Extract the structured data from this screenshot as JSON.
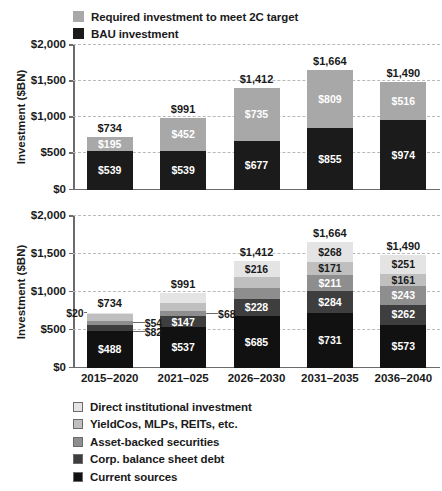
{
  "chart_data": [
    {
      "type": "bar",
      "id": "top",
      "stacked": true,
      "title": "",
      "xlabel": "",
      "ylabel": "Investment ($BN)",
      "ylim": [
        0,
        2000
      ],
      "yticks": [
        "$0",
        "$500",
        "$1,000",
        "$1,500",
        "$2,000"
      ],
      "ytick_values": [
        0,
        500,
        1000,
        1500,
        2000
      ],
      "grid": true,
      "legend_position": "top-left",
      "categories": [
        "2015–2020",
        "2021–025",
        "2026–2030",
        "2031–2035",
        "2036–2040"
      ],
      "series": [
        {
          "name": "BAU investment",
          "color": "#1b1b1b",
          "label_color": "#ffffff",
          "values": [
            539,
            539,
            677,
            855,
            974
          ],
          "labels": [
            "$539",
            "$539",
            "$677",
            "$855",
            "$974"
          ]
        },
        {
          "name": "Required investment to meet 2C target",
          "color": "#a8a8a8",
          "label_color": "#ffffff",
          "values": [
            195,
            452,
            735,
            809,
            516
          ],
          "labels": [
            "$195",
            "$452",
            "$735",
            "$809",
            "$516"
          ]
        }
      ],
      "totals": [
        734,
        991,
        1412,
        1664,
        1490
      ],
      "total_labels": [
        "$734",
        "$991",
        "$1,412",
        "$1,664",
        "$1,490"
      ]
    },
    {
      "type": "bar",
      "id": "bottom",
      "stacked": true,
      "title": "",
      "xlabel": "",
      "ylabel": "Investment ($BN)",
      "ylim": [
        0,
        2000
      ],
      "yticks": [
        "$0",
        "$500",
        "$1,000",
        "$1,500",
        "$2,000"
      ],
      "ytick_values": [
        0,
        500,
        1000,
        1500,
        2000
      ],
      "grid": true,
      "legend_position": "below",
      "categories": [
        "2015–2020",
        "2021–025",
        "2026–2030",
        "2031–2035",
        "2036–2040"
      ],
      "series": [
        {
          "name": "Current sources",
          "color": "#111111",
          "label_color": "#ffffff",
          "values": [
            488,
            537,
            685,
            731,
            573
          ],
          "labels": [
            "$488",
            "$537",
            "$685",
            "$731",
            "$573"
          ]
        },
        {
          "name": "Corp. balance sheet debt",
          "color": "#3e3e3e",
          "label_color": "#ffffff",
          "values": [
            82,
            147,
            228,
            284,
            262
          ],
          "labels": [
            "$82",
            "$147",
            "$228",
            "$284",
            "$262"
          ]
        },
        {
          "name": "Asset-backed securities",
          "color": "#8e8e8e",
          "label_color": "#ffffff",
          "values": [
            54,
            68,
            139,
            211,
            243
          ],
          "labels": [
            "$54",
            "$68",
            "$139",
            "$211",
            "$243"
          ]
        },
        {
          "name": "YieldCos, MLPs, REITs, etc.",
          "color": "#bfbfbf",
          "label_color": "#1a1a1a",
          "values": [
            89,
            102,
            144,
            171,
            161
          ],
          "labels": [
            "$89",
            "$102",
            "$144",
            "$171",
            "$161"
          ]
        },
        {
          "name": "Direct institutional investment",
          "color": "#e4e4e4",
          "label_color": "#1a1a1a",
          "values": [
            20,
            137,
            216,
            268,
            251
          ],
          "labels": [
            "$20",
            "$137",
            "$216",
            "$268",
            "$251"
          ]
        }
      ],
      "totals": [
        734,
        991,
        1412,
        1664,
        1490
      ],
      "total_labels": [
        "$734",
        "$991",
        "$1,412",
        "$1,664",
        "$1,490"
      ],
      "callouts": [
        {
          "label": "$20",
          "series": "Direct institutional investment",
          "category": "2015–2020",
          "side": "left"
        },
        {
          "label": "$54",
          "series": "Asset-backed securities",
          "category": "2015–2020",
          "side": "right"
        },
        {
          "label": "$82",
          "series": "Corp. balance sheet debt",
          "category": "2015–2020",
          "side": "right"
        },
        {
          "label": "$68",
          "series": "Asset-backed securities",
          "category": "2021–025",
          "side": "right"
        }
      ]
    }
  ],
  "top_chart": {
    "ylabel": "Investment ($BN)",
    "legend": [
      {
        "label": "Required investment to meet 2C target",
        "color": "#a8a8a8"
      },
      {
        "label": "BAU investment",
        "color": "#1b1b1b"
      }
    ],
    "yticks": [
      "$2,000",
      "$1,500",
      "$1,000",
      "$500",
      "$0"
    ],
    "totals": [
      "$734",
      "$991",
      "$1,412",
      "$1,664",
      "$1,490"
    ],
    "bars": [
      {
        "category": "2015–2020",
        "bau": "$539",
        "required": "$195"
      },
      {
        "category": "2021–025",
        "bau": "$539",
        "required": "$452"
      },
      {
        "category": "2026–2030",
        "bau": "$677",
        "required": "$735"
      },
      {
        "category": "2031–2035",
        "bau": "$855",
        "required": "$809"
      },
      {
        "category": "2036–2040",
        "bau": "$974",
        "required": "$516"
      }
    ]
  },
  "bottom_chart": {
    "ylabel": "Investment ($BN)",
    "yticks": [
      "$2,000",
      "$1,500",
      "$1,000",
      "$500",
      "$0"
    ],
    "totals": [
      "$734",
      "$991",
      "$1,412",
      "$1,664",
      "$1,490"
    ],
    "legend": [
      {
        "label": "Direct institutional investment",
        "color": "#e4e4e4"
      },
      {
        "label": "YieldCos, MLPs, REITs, etc.",
        "color": "#bfbfbf"
      },
      {
        "label": "Asset-backed securities",
        "color": "#8e8e8e"
      },
      {
        "label": "Corp. balance sheet debt",
        "color": "#3e3e3e"
      },
      {
        "label": "Current sources",
        "color": "#111111"
      }
    ],
    "callouts": {
      "c20": "$20",
      "c54": "$54",
      "c82": "$82",
      "c68": "$68"
    }
  },
  "xaxis": {
    "labels": [
      "2015–2020",
      "2021–025",
      "2026–2030",
      "2031–2035",
      "2036–2040"
    ]
  }
}
